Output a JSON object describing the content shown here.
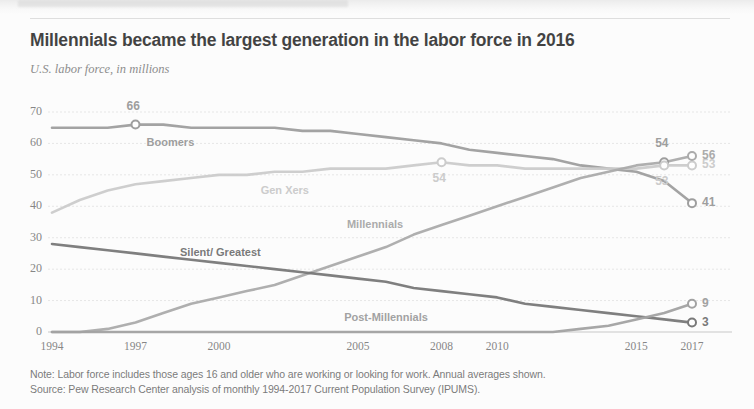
{
  "header": {
    "title": "Millennials became the largest generation in the labor force in 2016",
    "subtitle": "U.S. labor force, in millions"
  },
  "footer": {
    "note": "Note: Labor force includes those ages 16 and older who are working or looking for work. Annual averages shown.",
    "source": "Source: Pew Research Center analysis of monthly 1994-2017 Current Population Survey (IPUMS)."
  },
  "chart_data": {
    "type": "line",
    "title": "Millennials became the largest generation in the labor force in 2016",
    "subtitle": "U.S. labor force, in millions",
    "xlabel": "",
    "ylabel": "U.S. labor force, in millions",
    "xlim": [
      1994,
      2017
    ],
    "ylim": [
      0,
      70
    ],
    "yticks": [
      0,
      10,
      20,
      30,
      40,
      50,
      60,
      70
    ],
    "ytick_labels": [
      "0",
      "10",
      "20",
      "30",
      "40",
      "50",
      "60",
      "70"
    ],
    "xticks": [
      1994,
      1997,
      2000,
      2005,
      2008,
      2010,
      2015,
      2017
    ],
    "xtick_labels": [
      "1994",
      "1997",
      "2000",
      "2005",
      "2008",
      "2010",
      "2015",
      "2017"
    ],
    "grid": true,
    "grid_axis": "y",
    "legend": "inline-labels",
    "x": [
      1994,
      1995,
      1996,
      1997,
      1998,
      1999,
      2000,
      2001,
      2002,
      2003,
      2004,
      2005,
      2006,
      2007,
      2008,
      2009,
      2010,
      2011,
      2012,
      2013,
      2014,
      2015,
      2016,
      2017
    ],
    "series": [
      {
        "name": "Boomers",
        "color": "#8a8a8a",
        "values": [
          65,
          65,
          65,
          66,
          66,
          65,
          65,
          65,
          65,
          64,
          64,
          63,
          62,
          61,
          60,
          58,
          57,
          56,
          55,
          53,
          52,
          51,
          48,
          41
        ],
        "label_x": 1997.4,
        "label_y": 60,
        "end_label": "41",
        "annotations": [
          {
            "x": 1997,
            "y": 66,
            "text": "66",
            "marker": true
          },
          {
            "x": 2016,
            "y": 54,
            "text": "54",
            "marker": true
          }
        ]
      },
      {
        "name": "Gen Xers",
        "color": "#c2c2c2",
        "values": [
          38,
          42,
          45,
          47,
          48,
          49,
          50,
          50,
          51,
          51,
          52,
          52,
          52,
          53,
          54,
          53,
          53,
          52,
          52,
          52,
          52,
          52,
          53,
          53
        ],
        "label_x": 2001.5,
        "label_y": 45,
        "end_label": "53",
        "annotations": [
          {
            "x": 2008,
            "y": 54,
            "text": "54",
            "marker": true
          },
          {
            "x": 2016,
            "y": 53,
            "text": "53",
            "marker": true
          }
        ]
      },
      {
        "name": "Millennials",
        "color": "#9a9a9a",
        "values": [
          0,
          0,
          1,
          3,
          6,
          9,
          11,
          13,
          15,
          18,
          21,
          24,
          27,
          31,
          34,
          37,
          40,
          43,
          46,
          49,
          51,
          53,
          54,
          56
        ],
        "label_x": 2004.6,
        "label_y": 34,
        "end_label": "56",
        "annotations": []
      },
      {
        "name": "Silent/ Greatest",
        "color": "#5d5d5d",
        "values": [
          28,
          27,
          26,
          25,
          24,
          23,
          22,
          21,
          20,
          19,
          18,
          17,
          16,
          14,
          13,
          12,
          11,
          9,
          8,
          7,
          6,
          5,
          4,
          3
        ],
        "label_x": 1998.6,
        "label_y": 25,
        "end_label": "3",
        "annotations": []
      },
      {
        "name": "Post-Millennials",
        "color": "#8f8f8f",
        "values": [
          0,
          0,
          0,
          0,
          0,
          0,
          0,
          0,
          0,
          0,
          0,
          0,
          0,
          0,
          0,
          0,
          0,
          0,
          0,
          1,
          2,
          4,
          6,
          9
        ],
        "label_x": 2004.5,
        "label_y": 4.5,
        "end_label": "9",
        "annotations": []
      }
    ]
  }
}
